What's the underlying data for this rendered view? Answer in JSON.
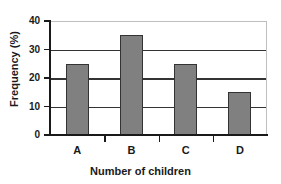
{
  "chart_data": {
    "type": "bar",
    "title": "",
    "subtitle": "",
    "categories": [
      "A",
      "B",
      "C",
      "D"
    ],
    "values": [
      25,
      35,
      25,
      15
    ],
    "series": [
      {
        "name": "Frequency",
        "values": [
          25,
          35,
          25,
          15
        ]
      }
    ],
    "xlabel": "Number of children",
    "ylabel": "Frequency (%)",
    "ylim": [
      0,
      40
    ],
    "ytick_labels": [
      "0",
      "10",
      "20",
      "30",
      "40"
    ],
    "ytick_values": [
      0,
      10,
      20,
      30,
      40
    ],
    "grid": "horizontal",
    "legend": "none",
    "annotations": [],
    "colors": {
      "bar_fill": "#808080",
      "bar_edge": "#333333",
      "gridline": "#333333",
      "axis": "#1a1a1a",
      "plot_border": "#bfbfbf",
      "background": "#ffffff",
      "text": "#1a1a1a"
    }
  }
}
